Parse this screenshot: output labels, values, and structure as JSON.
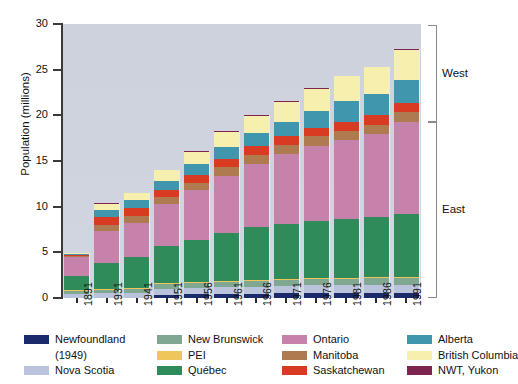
{
  "chart_data": {
    "type": "bar",
    "stacked": true,
    "title": "",
    "xlabel": "",
    "ylabel": "Population (millions)",
    "ylim": [
      0,
      30
    ],
    "yticks": [
      0,
      5,
      10,
      15,
      20,
      25,
      30
    ],
    "grid": false,
    "legend_position": "below",
    "categories": [
      "1891",
      "1931",
      "1941",
      "1951",
      "1956",
      "1961",
      "1966",
      "1971",
      "1976",
      "1981",
      "1986",
      "1991"
    ],
    "totals": [
      4.8,
      10.4,
      11.5,
      14.0,
      16.1,
      18.2,
      20.0,
      21.9,
      23.2,
      24.5,
      25.5,
      27.6
    ],
    "series": [
      {
        "name": "Newfoundland (1949)",
        "color": "#1b2a6b",
        "values": [
          0.0,
          0.0,
          0.0,
          0.36,
          0.42,
          0.46,
          0.49,
          0.52,
          0.56,
          0.57,
          0.57,
          0.57
        ]
      },
      {
        "name": "Nova Scotia",
        "color": "#b9c4dc",
        "values": [
          0.45,
          0.51,
          0.58,
          0.64,
          0.69,
          0.74,
          0.76,
          0.79,
          0.83,
          0.85,
          0.87,
          0.9
        ]
      },
      {
        "name": "New Brunswick",
        "color": "#7fa791",
        "values": [
          0.32,
          0.41,
          0.46,
          0.51,
          0.55,
          0.6,
          0.62,
          0.63,
          0.68,
          0.7,
          0.71,
          0.72
        ]
      },
      {
        "name": "PEI",
        "color": "#efc659",
        "values": [
          0.11,
          0.09,
          0.1,
          0.1,
          0.1,
          0.1,
          0.11,
          0.11,
          0.12,
          0.12,
          0.13,
          0.13
        ]
      },
      {
        "name": "Québec",
        "color": "#2f8c5a",
        "values": [
          1.49,
          2.87,
          3.33,
          4.06,
          4.63,
          5.26,
          5.78,
          6.03,
          6.23,
          6.44,
          6.54,
          6.9
        ]
      },
      {
        "name": "Ontario",
        "color": "#c682aa",
        "values": [
          2.11,
          3.43,
          3.79,
          4.6,
          5.4,
          6.24,
          6.96,
          7.7,
          8.26,
          8.63,
          9.1,
          10.08
        ]
      },
      {
        "name": "Manitoba",
        "color": "#b07a51",
        "values": [
          0.15,
          0.7,
          0.73,
          0.78,
          0.85,
          0.92,
          0.96,
          0.99,
          1.02,
          1.03,
          1.07,
          1.09
        ]
      },
      {
        "name": "Saskatchewan",
        "color": "#d93b22",
        "values": [
          0.09,
          0.92,
          0.9,
          0.83,
          0.88,
          0.93,
          0.96,
          0.93,
          0.92,
          0.97,
          1.01,
          0.99
        ]
      },
      {
        "name": "Alberta",
        "color": "#3f96ad",
        "values": [
          0.1,
          0.73,
          0.8,
          0.94,
          1.12,
          1.33,
          1.46,
          1.63,
          1.84,
          2.24,
          2.37,
          2.55
        ]
      },
      {
        "name": "British Columbia",
        "color": "#f7efae",
        "values": [
          0.1,
          0.69,
          0.82,
          1.17,
          1.4,
          1.63,
          1.87,
          2.18,
          2.47,
          2.74,
          2.89,
          3.28
        ]
      },
      {
        "name": "NWT, Yukon",
        "color": "#7e2451",
        "values": [
          0.02,
          0.02,
          0.02,
          0.03,
          0.03,
          0.04,
          0.05,
          0.06,
          0.07,
          0.07,
          0.08,
          0.09
        ]
      }
    ]
  },
  "axis": {
    "y_label": "Population (millions)",
    "y_ticks": [
      "0",
      "5",
      "10",
      "15",
      "20",
      "25",
      "30"
    ]
  },
  "brackets": [
    {
      "label": "West"
    },
    {
      "label": "East"
    }
  ],
  "legend": {
    "columns": [
      {
        "items": [
          {
            "label": "Newfoundland",
            "continuation": "(1949)",
            "color": "#1b2a6b",
            "icon": "legend-swatch"
          },
          {
            "label": "Nova Scotia",
            "color": "#b9c4dc",
            "icon": "legend-swatch"
          }
        ]
      },
      {
        "items": [
          {
            "label": "New Brunswick",
            "color": "#7fa791",
            "icon": "legend-swatch"
          },
          {
            "label": "PEI",
            "color": "#efc659",
            "icon": "legend-swatch"
          },
          {
            "label": "Québec",
            "color": "#2f8c5a",
            "icon": "legend-swatch"
          }
        ]
      },
      {
        "items": [
          {
            "label": "Ontario",
            "color": "#c682aa",
            "icon": "legend-swatch"
          },
          {
            "label": "Manitoba",
            "color": "#b07a51",
            "icon": "legend-swatch"
          },
          {
            "label": "Saskatchewan",
            "color": "#d93b22",
            "icon": "legend-swatch"
          }
        ]
      },
      {
        "items": [
          {
            "label": "Alberta",
            "color": "#3f96ad",
            "icon": "legend-swatch"
          },
          {
            "label": "British Columbia",
            "color": "#f7efae",
            "icon": "legend-swatch"
          },
          {
            "label": "NWT, Yukon",
            "color": "#7e2451",
            "icon": "legend-swatch"
          }
        ]
      }
    ]
  }
}
